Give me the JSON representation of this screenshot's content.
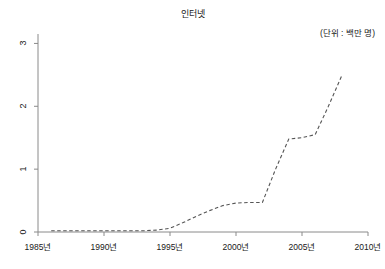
{
  "chart_data": {
    "type": "line",
    "title": "인터넷",
    "unit_note": "(단위 : 백만 명)",
    "xlabel": "",
    "ylabel": "",
    "xlim": [
      1985,
      2010
    ],
    "ylim": [
      0,
      3.15
    ],
    "grid": false,
    "legend": null,
    "line_style": "dashed",
    "line_color": "#555555",
    "x_ticks": [
      1985,
      1990,
      1995,
      2000,
      2005,
      2010
    ],
    "x_tick_labels": [
      "1985년",
      "1990년",
      "1995년",
      "2000년",
      "2005년",
      "2010년"
    ],
    "y_ticks": [
      0,
      1,
      2,
      3
    ],
    "y_tick_labels": [
      "0",
      "1",
      "2",
      "3"
    ],
    "series": [
      {
        "name": "인터넷",
        "x": [
          1986,
          1987,
          1988,
          1989,
          1990,
          1991,
          1992,
          1993,
          1994,
          1995,
          1996,
          1997,
          1998,
          1999,
          2000,
          2001,
          2002,
          2003,
          2004,
          2005,
          2006,
          2007,
          2008
        ],
        "values": [
          0.02,
          0.02,
          0.02,
          0.02,
          0.02,
          0.02,
          0.02,
          0.02,
          0.03,
          0.06,
          0.15,
          0.25,
          0.34,
          0.42,
          0.46,
          0.47,
          0.47,
          1.0,
          1.48,
          1.5,
          1.55,
          2.0,
          2.48
        ]
      }
    ]
  }
}
